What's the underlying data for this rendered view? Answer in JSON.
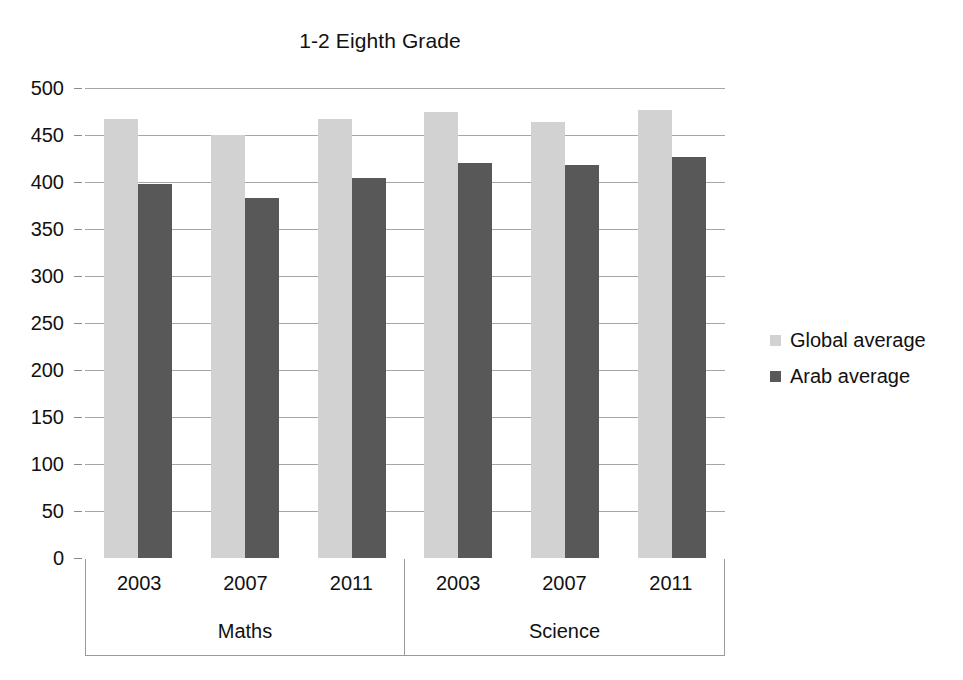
{
  "chart_data": {
    "type": "bar",
    "title": "1-2 Eighth Grade",
    "xlabel": "",
    "ylabel": "",
    "ylim": [
      0,
      500
    ],
    "ytick_step": 50,
    "yticks": [
      500,
      450,
      400,
      350,
      300,
      250,
      200,
      150,
      100,
      50,
      0
    ],
    "grid": true,
    "legend_position": "right",
    "groups": [
      "Maths",
      "Science"
    ],
    "categories": [
      "2003",
      "2007",
      "2011",
      "2003",
      "2007",
      "2011"
    ],
    "series": [
      {
        "name": "Global average",
        "color": "#d2d2d2",
        "values": [
          467,
          450,
          467,
          475,
          464,
          477
        ]
      },
      {
        "name": "Arab average",
        "color": "#585858",
        "values": [
          398,
          383,
          404,
          420,
          418,
          427
        ]
      }
    ]
  },
  "axis": {
    "y_labels": [
      "500",
      "450",
      "400",
      "350",
      "300",
      "250",
      "200",
      "150",
      "100",
      "50",
      "0"
    ]
  },
  "category_table": {
    "years": [
      "2003",
      "2007",
      "2011",
      "2003",
      "2007",
      "2011"
    ],
    "groups": [
      "Maths",
      "Science"
    ]
  },
  "legend": {
    "items": [
      {
        "label": "Global average",
        "color": "#d2d2d2"
      },
      {
        "label": "Arab average",
        "color": "#585858"
      }
    ]
  },
  "colors": {
    "global_average": "#d2d2d2",
    "arab_average": "#585858",
    "gridline": "#a6a6a6",
    "text": "#111111",
    "background": "#ffffff"
  }
}
